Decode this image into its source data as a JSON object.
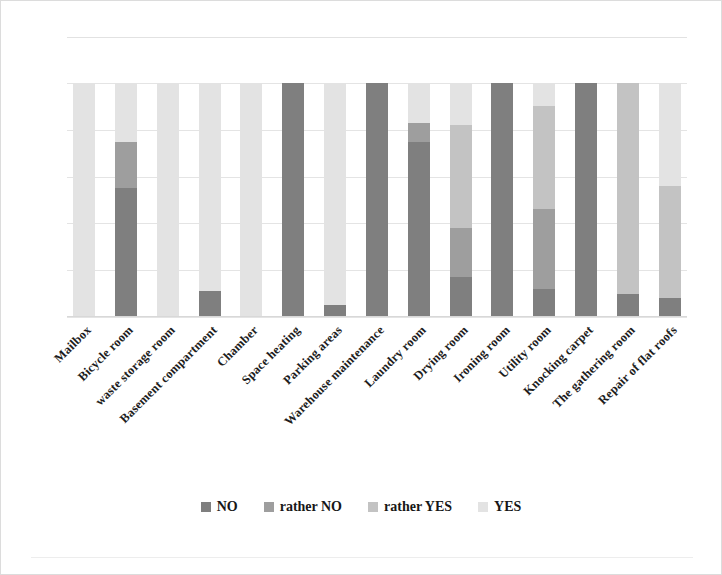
{
  "chart_data": {
    "type": "bar",
    "subtype": "stacked-bar-100-percent",
    "title": "",
    "xlabel": "",
    "ylabel": "",
    "ylim": [
      0,
      100
    ],
    "grid": true,
    "gridline_values": [
      0,
      20,
      40,
      60,
      80,
      100
    ],
    "legend_position": "bottom",
    "axis_tick_labels_visible": false,
    "categories": [
      "Mailbox",
      "Bicycle room",
      "waste storage room",
      "Basement compartment",
      "Chamber",
      "Space heating",
      "Parking areas",
      "Warehouse maintenance",
      "Laundry room",
      "Drying room",
      "Ironing room",
      "Utility room",
      "Knocking carpet",
      "The gathering room",
      "Repair of flat roofs"
    ],
    "series": [
      {
        "name": "NO",
        "color": "#7f7f7f",
        "values": [
          0,
          55,
          0,
          11,
          0,
          100,
          5,
          100,
          75,
          17,
          100,
          12,
          100,
          10,
          8
        ]
      },
      {
        "name": "rather NO",
        "color": "#9e9e9e",
        "values": [
          0,
          20,
          0,
          0,
          0,
          0,
          0,
          0,
          8,
          21,
          0,
          34,
          0,
          0,
          0
        ]
      },
      {
        "name": "rather YES",
        "color": "#c3c3c3",
        "values": [
          0,
          0,
          0,
          0,
          0,
          0,
          0,
          0,
          0,
          44,
          0,
          44,
          0,
          90,
          48
        ]
      },
      {
        "name": "YES",
        "color": "#e3e3e3",
        "values": [
          100,
          25,
          100,
          89,
          100,
          0,
          95,
          0,
          17,
          18,
          0,
          10,
          0,
          0,
          44
        ]
      }
    ]
  },
  "legend": {
    "items": [
      {
        "label": "NO",
        "color": "#7f7f7f"
      },
      {
        "label": "rather NO",
        "color": "#9e9e9e"
      },
      {
        "label": "rather YES",
        "color": "#c3c3c3"
      },
      {
        "label": "YES",
        "color": "#e3e3e3"
      }
    ]
  },
  "colors": {
    "gridline": "#e4e4e4",
    "axis": "#d8d8d8",
    "frame": "#dcdcdc",
    "background": "#ffffff",
    "label_text": "#1d1d1d"
  }
}
